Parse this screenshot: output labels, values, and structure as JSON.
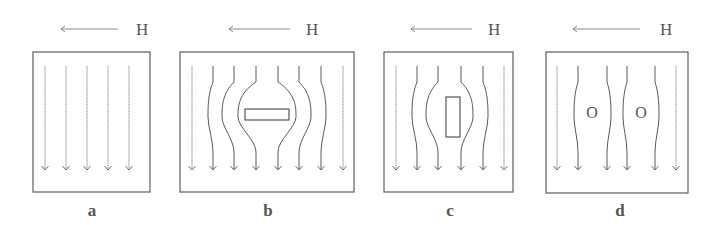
{
  "figure": {
    "field_symbol": "H",
    "colors": {
      "frame": "#6a6a6a",
      "line": "#8a8a8a",
      "text": "#555555"
    },
    "panels": [
      {
        "id": "a",
        "label": "a",
        "box": {
          "x": 33,
          "y": 52,
          "w": 117,
          "h": 140
        },
        "label_pos": {
          "x": 92,
          "y": 216
        },
        "h_arrow": {
          "x1": 118,
          "x2": 61,
          "y": 29
        },
        "h_label_pos": {
          "x": 136,
          "y": 35
        },
        "lines": [
          {
            "x": 45,
            "bend": 0
          },
          {
            "x": 66,
            "bend": 0
          },
          {
            "x": 87,
            "bend": 0
          },
          {
            "x": 108,
            "bend": 0
          },
          {
            "x": 129,
            "bend": 0
          }
        ],
        "specimen": null
      },
      {
        "id": "b",
        "label": "b",
        "box": {
          "x": 180,
          "y": 52,
          "w": 174,
          "h": 140
        },
        "label_pos": {
          "x": 268,
          "y": 216
        },
        "h_arrow": {
          "x1": 290,
          "x2": 229,
          "y": 29
        },
        "h_label_pos": {
          "x": 306,
          "y": 35
        },
        "lines": [
          {
            "x": 192,
            "bend": 0
          },
          {
            "x": 213,
            "bend": -5
          },
          {
            "x": 234,
            "bend": -12
          },
          {
            "x": 256,
            "bend": -18
          },
          {
            "x": 278,
            "bend": 18
          },
          {
            "x": 299,
            "bend": 12
          },
          {
            "x": 321,
            "bend": 5
          },
          {
            "x": 343,
            "bend": 0
          }
        ],
        "specimen": {
          "shape": "rect",
          "x": 245,
          "y": 109,
          "w": 44,
          "h": 11
        }
      },
      {
        "id": "c",
        "label": "c",
        "box": {
          "x": 384,
          "y": 52,
          "w": 129,
          "h": 140
        },
        "label_pos": {
          "x": 450,
          "y": 216
        },
        "h_arrow": {
          "x1": 472,
          "x2": 411,
          "y": 29
        },
        "h_label_pos": {
          "x": 488,
          "y": 35
        },
        "lines": [
          {
            "x": 396,
            "bend": 0
          },
          {
            "x": 417,
            "bend": -5
          },
          {
            "x": 438,
            "bend": -12
          },
          {
            "x": 461,
            "bend": 12
          },
          {
            "x": 483,
            "bend": 5
          },
          {
            "x": 504,
            "bend": 0
          }
        ],
        "specimen": {
          "shape": "rect",
          "x": 446,
          "y": 97,
          "w": 14,
          "h": 40
        }
      },
      {
        "id": "d",
        "label": "d",
        "box": {
          "x": 546,
          "y": 52,
          "w": 142,
          "h": 141
        },
        "label_pos": {
          "x": 620,
          "y": 216
        },
        "h_arrow": {
          "x1": 640,
          "x2": 573,
          "y": 29
        },
        "h_label_pos": {
          "x": 660,
          "y": 35
        },
        "lines": [
          {
            "x": 557,
            "bend": 0
          },
          {
            "x": 578,
            "bend": -4
          },
          {
            "x": 607,
            "bend": 4
          },
          {
            "x": 627,
            "bend": -4
          },
          {
            "x": 655,
            "bend": 4
          },
          {
            "x": 676,
            "bend": 0
          }
        ],
        "specimen": {
          "shape": "holes",
          "items": [
            {
              "text": "O",
              "x": 592,
              "y": 118
            },
            {
              "text": "O",
              "x": 641,
              "y": 118
            }
          ]
        }
      }
    ],
    "line_y_start": 66,
    "line_y_end": 170,
    "bend_y_start": 82,
    "bend_y_end": 152
  }
}
